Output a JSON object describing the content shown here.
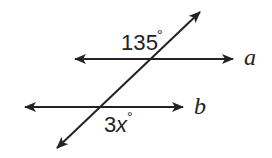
{
  "diagram": {
    "type": "parallel-lines-cut-by-transversal",
    "colors": {
      "stroke": "#222222",
      "background": "#ffffff"
    },
    "lines": [
      {
        "id": "a",
        "label": "a",
        "kind": "parallel",
        "from": [
          75,
          59
        ],
        "to": [
          233,
          59
        ],
        "arrows": "both"
      },
      {
        "id": "b",
        "label": "b",
        "kind": "parallel",
        "from": [
          25,
          107
        ],
        "to": [
          183,
          107
        ],
        "arrows": "both"
      },
      {
        "id": "t",
        "label": "",
        "kind": "transversal",
        "from": [
          57,
          148
        ],
        "to": [
          200,
          12
        ],
        "arrows": "both"
      }
    ],
    "angles": [
      {
        "at_line": "a",
        "value_text": "135",
        "degree_symbol": "°",
        "position": "above line a, left of transversal"
      },
      {
        "at_line": "b",
        "value_text": "3x",
        "degree_symbol": "°",
        "position": "below line b, right of transversal"
      }
    ],
    "labels": {
      "line_a": "a",
      "line_b": "b",
      "angle_top": "135",
      "angle_top_deg": "°",
      "angle_bottom_num": "3",
      "angle_bottom_var": "x",
      "angle_bottom_deg": "°"
    }
  }
}
